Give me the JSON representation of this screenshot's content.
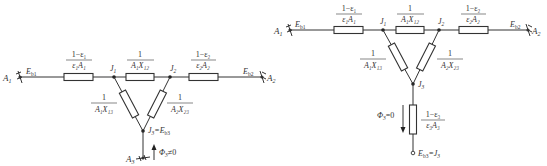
{
  "diagram_left": {
    "nodes": {
      "A1": "A₁",
      "Eb1": "Eₑ₁",
      "J1": "J₁",
      "J2": "J₂",
      "Eb2": "Eₑ₂",
      "A2": "A₂",
      "J3": "J₃=Eₑ₃",
      "A3": "A₃"
    },
    "labels": {
      "A1": "A",
      "A1_sub": "1",
      "Eb1": "E",
      "Eb1_sub": "b1",
      "J1": "J",
      "J1_sub": "1",
      "J2": "J",
      "J2_sub": "2",
      "Eb2": "E",
      "Eb2_sub": "b2",
      "A2": "A",
      "A2_sub": "2",
      "J3": "J",
      "J3_sub": "3",
      "J3_eq": "=E",
      "J3_eq_sub": "b3",
      "A3": "A",
      "A3_sub": "3",
      "phi": "Φ",
      "phi_sub": "3",
      "phi_val": "≠0"
    },
    "resistors": {
      "r1": {
        "num": "1−ε₁",
        "den": "ε₁A₁"
      },
      "r12": {
        "num": "1",
        "den": "A₁X₁₂"
      },
      "r2": {
        "num": "1−ε₂",
        "den": "ε₂A₂"
      },
      "r13": {
        "num": "1",
        "den": "A₁X₁₃"
      },
      "r23": {
        "num": "1",
        "den": "A₂X₂₃"
      }
    }
  },
  "diagram_right": {
    "labels": {
      "A1": "A",
      "A1_sub": "1",
      "Eb1": "E",
      "Eb1_sub": "b1",
      "J1": "J",
      "J1_sub": "1",
      "J2": "J",
      "J2_sub": "2",
      "Eb2": "E",
      "Eb2_sub": "b2",
      "A2": "A",
      "A2_sub": "2",
      "J3": "J",
      "J3_sub": "3",
      "phi": "Φ",
      "phi_sub": "3",
      "phi_val": "=0",
      "Eb3": "E",
      "Eb3_sub": "b3",
      "Eb3_eq": "=J",
      "Eb3_eq_sub": "3"
    },
    "resistors": {
      "r1": {
        "num": "1−ε₁",
        "den": "ε₁A₁"
      },
      "r12": {
        "num": "1",
        "den": "A₁X₁₂"
      },
      "r2": {
        "num": "1−ε₂",
        "den": "ε₂A₂"
      },
      "r13": {
        "num": "1",
        "den": "A₁X₁₃"
      },
      "r23": {
        "num": "1",
        "den": "A₂X₂₃"
      },
      "r3": {
        "num": "1−ε₃",
        "den": "ε₃A₃"
      }
    }
  }
}
